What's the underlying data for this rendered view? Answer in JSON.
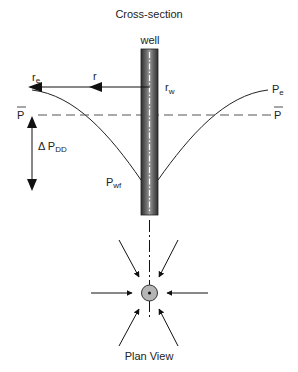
{
  "title": "Cross-section",
  "well_label": "well",
  "labels": {
    "re_main": "r",
    "re_sub": "e",
    "r": "r",
    "rw_main": "r",
    "rw_sub": "w",
    "pe_main": "P",
    "pe_sub": "e",
    "pbar_left": "P",
    "pbar_right": "P",
    "dpdd_main": "Δ P",
    "dpdd_sub": "DD",
    "pwf_main": "P",
    "pwf_sub": "wf"
  },
  "plan_view_label": "Plan View",
  "colors": {
    "well_dark": "#3a3a3a",
    "well_mid": "#8a8a8a",
    "plan_circle": "#b5b5b5",
    "line": "#111111"
  }
}
